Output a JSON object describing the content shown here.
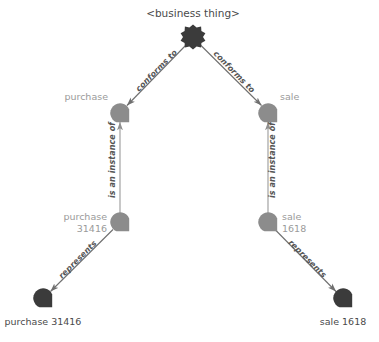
{
  "diagram": {
    "title_node": {
      "label": "<business thing>",
      "shape": "star-burst",
      "color": "#3b3b3b"
    },
    "nodes": [
      {
        "id": "root",
        "label": "<business thing>",
        "shape": "star-burst",
        "color": "#3b3b3b",
        "label_color": "#4a4a4a",
        "cx": 193,
        "cy": 37
      },
      {
        "id": "purchase",
        "label": "purchase",
        "shape": "circle-notch",
        "color": "#8c8c8c",
        "label_color": "#9a9a9a",
        "cx": 120,
        "cy": 113
      },
      {
        "id": "sale",
        "label": "sale",
        "shape": "circle-notch",
        "color": "#8c8c8c",
        "label_color": "#9a9a9a",
        "cx": 268,
        "cy": 113
      },
      {
        "id": "purchase31416",
        "label_line1": "purchase",
        "label_line2": "31416",
        "shape": "circle-notch",
        "color": "#8c8c8c",
        "label_color": "#9a9a9a",
        "cx": 120,
        "cy": 222
      },
      {
        "id": "sale1618",
        "label_line1": "sale",
        "label_line2": "1618",
        "shape": "circle-notch",
        "color": "#8c8c8c",
        "label_color": "#9a9a9a",
        "cx": 268,
        "cy": 222
      },
      {
        "id": "purchase31416real",
        "label": "purchase 31416",
        "shape": "circle-notch",
        "color": "#3b3b3b",
        "label_color": "#4a4a4a",
        "cx": 43,
        "cy": 298
      },
      {
        "id": "sale1618real",
        "label": "sale 1618",
        "shape": "circle-notch",
        "color": "#3b3b3b",
        "label_color": "#4a4a4a",
        "cx": 343,
        "cy": 298
      }
    ],
    "edges": [
      {
        "id": "e1",
        "from": "purchase",
        "to": "root",
        "label": "conforms to"
      },
      {
        "id": "e2",
        "from": "sale",
        "to": "root",
        "label": "conforms to"
      },
      {
        "id": "e3",
        "from": "purchase31416",
        "to": "purchase",
        "label": "is an instance of"
      },
      {
        "id": "e4",
        "from": "sale1618",
        "to": "sale",
        "label": "is an instance of"
      },
      {
        "id": "e5",
        "from": "purchase31416",
        "to": "purchase31416real",
        "label": "represents"
      },
      {
        "id": "e6",
        "from": "sale1618",
        "to": "sale1618real",
        "label": "represents"
      }
    ],
    "labels": {
      "root": "<business thing>",
      "purchase": "purchase",
      "sale": "sale",
      "purchase_instance_l1": "purchase",
      "purchase_instance_l2": "31416",
      "sale_instance_l1": "sale",
      "sale_instance_l2": "1618",
      "purchase_real": "purchase 31416",
      "sale_real": "sale 1618",
      "conforms_to_left": "conforms to",
      "conforms_to_right": "conforms to",
      "instance_of_left": "is an instance of",
      "instance_of_right": "is an instance of",
      "represents_left": "represents",
      "represents_right": "represents"
    },
    "colors": {
      "node_dark": "#3b3b3b",
      "node_gray": "#8c8c8c",
      "edge": "#6f6f6f",
      "label_gray": "#9a9a9a",
      "label_dark": "#4a4a4a",
      "background": "#ffffff"
    }
  }
}
